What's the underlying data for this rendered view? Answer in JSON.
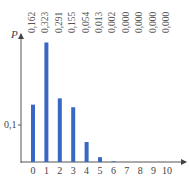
{
  "chart_data": {
    "type": "bar",
    "title": "",
    "xlabel": "",
    "ylabel": "P",
    "categories": [
      "0",
      "1",
      "2",
      "3",
      "4",
      "5",
      "6",
      "7",
      "8",
      "9",
      "10"
    ],
    "values": [
      0.162,
      0.323,
      0.291,
      0.155,
      0.054,
      0.013,
      0.002,
      0.0,
      0.0,
      0.0,
      0.0
    ],
    "value_labels": [
      "0,162",
      "0,323",
      "0,291",
      "0,155",
      "0,054",
      "0,013",
      "0,002",
      "0,000",
      "0,000",
      "0,000",
      "0,000"
    ],
    "bar_heights_drawn": [
      0.155,
      0.323,
      0.172,
      0.148,
      0.054,
      0.013,
      0.002,
      0.0,
      0.0,
      0.0,
      0.0
    ],
    "y_ticks": [
      {
        "value": 0.1,
        "label": "0,1"
      }
    ],
    "ylim": [
      0,
      0.34
    ],
    "grid": false,
    "bar_color": "#3a66c4"
  },
  "axis": {
    "y_label": "P",
    "y_tick_label": "0,1"
  }
}
